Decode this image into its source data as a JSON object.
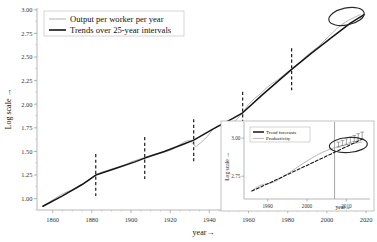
{
  "chart_data": {
    "type": "line",
    "title": "",
    "xlabel": "year→",
    "ylabel": "Log scale →",
    "xlim": [
      1852,
      2022
    ],
    "ylim": [
      0.88,
      3.02
    ],
    "grid": false,
    "legend_position": "top-left",
    "xticks": [
      1860,
      1880,
      1900,
      1920,
      1940,
      1960,
      1980,
      2000,
      2020
    ],
    "xtick_labels": [
      "1860",
      "1880",
      "1900",
      "1920",
      "1940",
      "1960",
      "1980",
      "2000",
      "2020"
    ],
    "yticks": [
      1.0,
      1.25,
      1.5,
      1.75,
      2.0,
      2.25,
      2.5,
      2.75,
      3.0
    ],
    "ytick_labels": [
      "1.00",
      "1.25",
      "1.50",
      "1.75",
      "2.00",
      "2.25",
      "2.50",
      "2.75",
      "3.00"
    ],
    "break_years": [
      1882,
      1907,
      1932,
      1957,
      1982
    ],
    "annotations": [
      {
        "type": "ellipse",
        "label": "recent-slowdown-highlight",
        "x": 2010,
        "y": 2.93
      }
    ],
    "series": [
      {
        "name": "Output per worker per year",
        "style": "thin-gray",
        "x": [
          1855,
          1858,
          1861,
          1864,
          1867,
          1870,
          1873,
          1876,
          1879,
          1882,
          1885,
          1888,
          1891,
          1894,
          1897,
          1900,
          1903,
          1906,
          1909,
          1912,
          1915,
          1918,
          1921,
          1924,
          1927,
          1930,
          1933,
          1936,
          1939,
          1942,
          1945,
          1948,
          1951,
          1954,
          1957,
          1960,
          1963,
          1966,
          1969,
          1972,
          1975,
          1978,
          1981,
          1984,
          1987,
          1990,
          1993,
          1996,
          1999,
          2002,
          2005,
          2008,
          2011,
          2014,
          2017
        ],
        "y": [
          0.92,
          0.96,
          1.0,
          1.04,
          1.07,
          1.09,
          1.12,
          1.16,
          1.2,
          1.25,
          1.28,
          1.3,
          1.32,
          1.34,
          1.36,
          1.39,
          1.41,
          1.43,
          1.45,
          1.47,
          1.48,
          1.5,
          1.52,
          1.56,
          1.6,
          1.62,
          1.55,
          1.6,
          1.66,
          1.74,
          1.78,
          1.76,
          1.79,
          1.84,
          1.91,
          2.0,
          2.06,
          2.11,
          2.17,
          2.22,
          2.26,
          2.31,
          2.36,
          2.41,
          2.46,
          2.52,
          2.57,
          2.62,
          2.68,
          2.74,
          2.8,
          2.85,
          2.89,
          2.92,
          2.95
        ]
      },
      {
        "name": "Trends over 25-year intervals",
        "style": "thick-black",
        "x": [
          1855,
          1865,
          1875,
          1882,
          1892,
          1902,
          1907,
          1917,
          1927,
          1932,
          1942,
          1952,
          1957,
          1967,
          1977,
          1982,
          1992,
          2002,
          2012,
          2019
        ],
        "y": [
          0.92,
          1.03,
          1.15,
          1.25,
          1.32,
          1.39,
          1.43,
          1.5,
          1.58,
          1.62,
          1.74,
          1.85,
          1.91,
          2.1,
          2.28,
          2.37,
          2.54,
          2.7,
          2.86,
          2.95
        ]
      }
    ],
    "legend": [
      {
        "label": "Output per worker per year",
        "style": "thin-gray"
      },
      {
        "label": "Trends over 25-year intervals",
        "style": "thick-black"
      }
    ]
  },
  "inset_chart_data": {
    "type": "line",
    "title": "",
    "xlabel": "year→",
    "ylabel": "Log scale →",
    "xlim": [
      1984,
      2016
    ],
    "ylim": [
      2.6,
      3.08
    ],
    "grid": false,
    "legend_position": "top-left",
    "xticks": [
      1990,
      2000,
      2010
    ],
    "xtick_labels": [
      "1990",
      "2000",
      "2010"
    ],
    "yticks": [
      2.75,
      3.0
    ],
    "ytick_labels": [
      "2.75",
      "3.00"
    ],
    "forecast_start_year": 2007,
    "annotations": [
      {
        "type": "ellipse",
        "label": "forecast-gap-highlight",
        "x": 2010.5,
        "y": 2.955
      }
    ],
    "series": [
      {
        "name": "Productivity",
        "style": "thin-gray",
        "x": [
          1986,
          1987,
          1988,
          1989,
          1990,
          1991,
          1992,
          1993,
          1994,
          1995,
          1996,
          1997,
          1998,
          1999,
          2000,
          2001,
          2002,
          2003,
          2004,
          2005,
          2006,
          2007,
          2008,
          2009,
          2010,
          2011,
          2012,
          2013,
          2014
        ],
        "y": [
          2.655,
          2.672,
          2.688,
          2.697,
          2.7,
          2.706,
          2.716,
          2.731,
          2.748,
          2.764,
          2.781,
          2.799,
          2.817,
          2.834,
          2.85,
          2.866,
          2.881,
          2.895,
          2.908,
          2.919,
          2.929,
          2.938,
          2.945,
          2.951,
          2.957,
          2.962,
          2.966,
          2.97,
          2.974
        ]
      },
      {
        "name": "Trend forecasts",
        "style": "dashed-black",
        "x": [
          1986,
          1990,
          1994,
          1998,
          2002,
          2006,
          2010,
          2014
        ],
        "y": [
          2.652,
          2.7,
          2.748,
          2.797,
          2.846,
          2.895,
          2.944,
          2.993
        ]
      }
    ],
    "error_bars": [
      {
        "x": 2008,
        "y": 2.958,
        "err": 0.016
      },
      {
        "x": 2009,
        "y": 2.968,
        "err": 0.017
      },
      {
        "x": 2010,
        "y": 2.978,
        "err": 0.018
      },
      {
        "x": 2011,
        "y": 2.988,
        "err": 0.019
      },
      {
        "x": 2012,
        "y": 2.998,
        "err": 0.02
      },
      {
        "x": 2013,
        "y": 3.008,
        "err": 0.021
      },
      {
        "x": 2014,
        "y": 3.018,
        "err": 0.022
      }
    ],
    "legend": [
      {
        "label": "Trend forecasts",
        "style": "thick-black"
      },
      {
        "label": "Productivity",
        "style": "thin-gray"
      }
    ]
  }
}
